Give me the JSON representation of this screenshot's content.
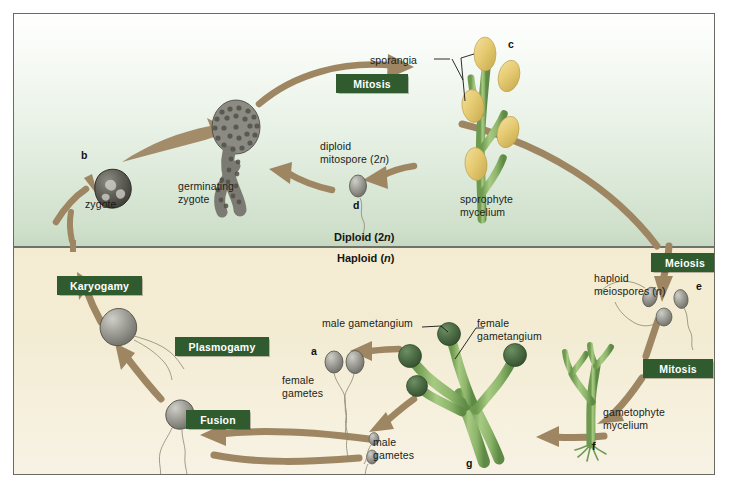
{
  "figure": {
    "ploidy_regions": {
      "diploid_label": "Diploid (2n)",
      "haploid_label": "Haploid (n)"
    },
    "colors": {
      "process_box": "#2f5b2f",
      "process_box_text": "#ffffff",
      "arrow": "#9e8663",
      "diploid_bg_top": "#ffffff",
      "diploid_bg_bottom": "#c6d8c2",
      "haploid_bg": "#f3ecd4",
      "divider": "#6f7268",
      "sporangium_fill": "#e8cf7e",
      "hypha_green": "#8cb56a",
      "gametangium_dark": "#4a6b45",
      "gamete_gray": "#9a9a93",
      "zygote_gray": "#5d5d56",
      "frame_border": "#6b6b63"
    },
    "process_boxes": [
      {
        "id": "mitosis-top",
        "label": "Mitosis",
        "x": 322,
        "y": 60,
        "w": 72,
        "h": 19
      },
      {
        "id": "meiosis",
        "label": "Meiosis",
        "x": 637,
        "y": 239,
        "w": 68,
        "h": 19
      },
      {
        "id": "mitosis-bottom",
        "label": "Mitosis",
        "x": 629,
        "y": 345,
        "w": 70,
        "h": 19
      },
      {
        "id": "karyogamy",
        "label": "Karyogamy",
        "x": 43,
        "y": 262,
        "w": 85,
        "h": 19
      },
      {
        "id": "plasmogamy",
        "label": "Plasmogamy",
        "x": 161,
        "y": 323,
        "w": 94,
        "h": 19
      },
      {
        "id": "fusion",
        "label": "Fusion",
        "x": 172,
        "y": 396,
        "w": 64,
        "h": 19
      }
    ],
    "labels": [
      {
        "id": "sporangia",
        "text": "sporangia",
        "x": 412,
        "y": 50
      },
      {
        "id": "sporophyte-mycelium",
        "text": "sporophyte\nmycelium",
        "x": 459,
        "y": 189
      },
      {
        "id": "diploid-mitospore",
        "text": "diploid\nmitospore (2n)",
        "x": 320,
        "y": 138
      },
      {
        "id": "germinating-zygote",
        "text": "germinating\nzygote",
        "x": 180,
        "y": 176
      },
      {
        "id": "zygote",
        "text": "zygote",
        "x": 83,
        "y": 192
      },
      {
        "id": "haploid-meiospores",
        "text": "haploid\nmeiospores (n)",
        "x": 591,
        "y": 272
      },
      {
        "id": "gametophyte-mycelium",
        "text": "gametophyte\nmycelium",
        "x": 602,
        "y": 402
      },
      {
        "id": "male-gametangium",
        "text": "male gametangium",
        "x": 322,
        "y": 312
      },
      {
        "id": "female-gametangium",
        "text": "female\ngametangium",
        "x": 475,
        "y": 312
      },
      {
        "id": "female-gametes",
        "text": "female\ngametes",
        "x": 281,
        "y": 370
      },
      {
        "id": "male-gametes",
        "text": "male\ngametes",
        "x": 372,
        "y": 432
      }
    ],
    "markers": [
      {
        "id": "marker-a",
        "text": "a",
        "x": 310,
        "y": 342
      },
      {
        "id": "marker-b",
        "text": "b",
        "x": 80,
        "y": 146
      },
      {
        "id": "marker-c",
        "text": "c",
        "x": 507,
        "y": 35
      },
      {
        "id": "marker-d",
        "text": "d",
        "x": 352,
        "y": 196
      },
      {
        "id": "marker-e",
        "text": "e",
        "x": 695,
        "y": 277
      },
      {
        "id": "marker-f",
        "text": "f",
        "x": 591,
        "y": 435
      },
      {
        "id": "marker-g",
        "text": "g",
        "x": 465,
        "y": 452
      }
    ],
    "structures": [
      {
        "id": "sporophyte",
        "type": "sporangia-stalk",
        "description": "green branched hypha bearing five oval yellow sporangia"
      },
      {
        "id": "gametophyte",
        "type": "gametophyte-stalk",
        "description": "green branched hypha bearing four dark green spherical gametangia"
      },
      {
        "id": "zygote-cell",
        "type": "zygote",
        "description": "dark gray rounded zygote cell"
      },
      {
        "id": "germinating-zygote-cell",
        "type": "germinating-zygote",
        "description": "gray granular zygote with emerging germ tube"
      },
      {
        "id": "diploid-mitospore-cell",
        "type": "flagellated-spore",
        "description": "gray oval spore with single trailing flagellum"
      },
      {
        "id": "meiospore-cells",
        "type": "flagellated-spore-group",
        "description": "three gray flagellated meiospores"
      },
      {
        "id": "female-gamete-cells",
        "type": "flagellated-gamete-pair",
        "description": "two large gray flagellated female gametes"
      },
      {
        "id": "male-gamete-cells",
        "type": "flagellated-gamete-pair",
        "description": "two small gray flagellated male gametes"
      },
      {
        "id": "plasmogamy-cell",
        "type": "fused-cell",
        "description": "gray cell after plasmogamy with two flagella"
      },
      {
        "id": "fusion-cell",
        "type": "fusing-cell",
        "description": "gray cell pair fusing with flagella"
      }
    ],
    "arrows": [
      {
        "id": "arrow-zygote-to-germinating",
        "from": "zygote",
        "to": "germinating zygote"
      },
      {
        "id": "arrow-germinating-to-sporophyte",
        "from": "germinating zygote",
        "to": "sporophyte (via Mitosis)"
      },
      {
        "id": "arrow-sporophyte-to-mitospore",
        "from": "sporophyte",
        "to": "diploid mitospore"
      },
      {
        "id": "arrow-mitospore-to-germinating",
        "from": "diploid mitospore",
        "to": "germinating zygote"
      },
      {
        "id": "arrow-sporophyte-to-meiosis",
        "from": "sporophyte",
        "to": "meiospores (via Meiosis)"
      },
      {
        "id": "arrow-meiospores-to-gametophyte",
        "from": "meiospores",
        "to": "gametophyte (via Mitosis)"
      },
      {
        "id": "arrow-gametophyte-to-gametes",
        "from": "gametophyte",
        "to": "gametes"
      },
      {
        "id": "arrow-gametangium-to-female-gametes",
        "from": "female gametangium",
        "to": "female gametes"
      },
      {
        "id": "arrow-gametangium-to-male-gametes",
        "from": "male gametangium",
        "to": "male gametes"
      },
      {
        "id": "arrow-gametes-to-fusion",
        "from": "gametes",
        "to": "fusion"
      },
      {
        "id": "arrow-fusion-to-plasmogamy",
        "from": "fusion",
        "to": "plasmogamy"
      },
      {
        "id": "arrow-plasmogamy-to-karyogamy",
        "from": "plasmogamy",
        "to": "karyogamy"
      },
      {
        "id": "arrow-karyogamy-to-zygote",
        "from": "karyogamy",
        "to": "zygote"
      }
    ]
  }
}
